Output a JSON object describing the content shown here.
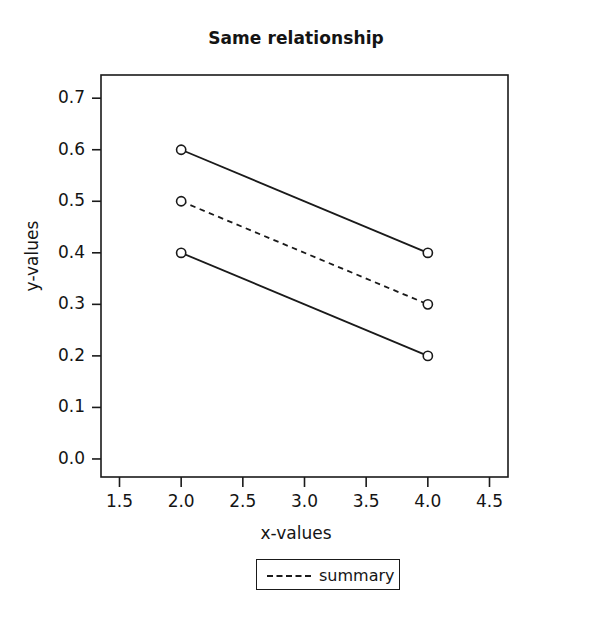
{
  "chart_data": {
    "type": "line",
    "title": "Same relationship",
    "xlabel": "x-values",
    "ylabel": "y-values",
    "xlim": [
      1.35,
      4.65
    ],
    "ylim": [
      -0.035,
      0.745
    ],
    "grid": false,
    "x": [
      2.0,
      4.0
    ],
    "xticks": [
      "1.5",
      "2.0",
      "2.5",
      "3.0",
      "3.5",
      "4.0",
      "4.5"
    ],
    "xtickvalues": [
      1.5,
      2.0,
      2.5,
      3.0,
      3.5,
      4.0,
      4.5
    ],
    "yticks": [
      "0.0",
      "0.1",
      "0.2",
      "0.3",
      "0.4",
      "0.5",
      "0.6",
      "0.7"
    ],
    "ytickvalues": [
      0.0,
      0.1,
      0.2,
      0.3,
      0.4,
      0.5,
      0.6,
      0.7
    ],
    "series": [
      {
        "name": "upper",
        "values": [
          0.6,
          0.4
        ],
        "linestyle": "solid",
        "marker": "circle",
        "color": "#1a1a1a"
      },
      {
        "name": "summary",
        "values": [
          0.5,
          0.3
        ],
        "linestyle": "dashed",
        "marker": "circle",
        "color": "#1a1a1a"
      },
      {
        "name": "lower",
        "values": [
          0.4,
          0.2
        ],
        "linestyle": "solid",
        "marker": "circle",
        "color": "#1a1a1a"
      }
    ],
    "legend": {
      "position": "below-axis-center",
      "entries": [
        {
          "label": "summary",
          "linestyle": "dashed",
          "color": "#1a1a1a"
        }
      ]
    },
    "axis_color": "#1a1a1a",
    "background": "#ffffff"
  }
}
